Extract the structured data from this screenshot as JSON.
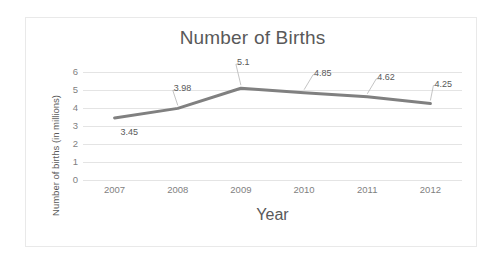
{
  "chart_data": {
    "type": "line",
    "title": "Number of Births",
    "xlabel": "Year",
    "ylabel": "Number of births (in millions)",
    "categories": [
      "2007",
      "2008",
      "2009",
      "2010",
      "2011",
      "2012"
    ],
    "values": [
      3.45,
      3.98,
      5.1,
      4.85,
      4.62,
      4.25
    ],
    "data_labels": [
      "3.45",
      "3.98",
      "5.1",
      "4.85",
      "4.62",
      "4.25"
    ],
    "ylim": [
      0,
      6
    ],
    "y_ticks": [
      "0",
      "1",
      "2",
      "3",
      "4",
      "5",
      "6"
    ],
    "grid": true,
    "legend": "none",
    "series_color": "#808080",
    "grid_color": "#e4e4e4",
    "text_color": "#595959",
    "tick_color": "#7f7f7f",
    "border_color": "#e9e9e9"
  }
}
